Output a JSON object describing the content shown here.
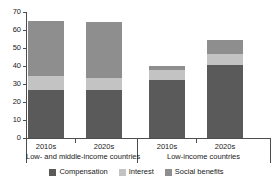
{
  "chart_data": {
    "type": "bar",
    "subtype": "stacked-grouped",
    "title": "",
    "xlabel": "",
    "ylabel": "",
    "ylim": [
      0,
      70
    ],
    "yticks": [
      0,
      10,
      20,
      30,
      40,
      50,
      60,
      70
    ],
    "grid": false,
    "legend_position": "bottom",
    "categories": [
      "2010s",
      "2020s",
      "2010s",
      "2020s"
    ],
    "groups": [
      {
        "label": "Low- and middle-income countries",
        "categories": [
          "2010s",
          "2020s"
        ]
      },
      {
        "label": "Low-income countries",
        "categories": [
          "2010s",
          "2020s"
        ]
      }
    ],
    "series": [
      {
        "name": "Compensation",
        "color": "#5a5a5a",
        "values": [
          26.5,
          26.5,
          32.0,
          40.5
        ]
      },
      {
        "name": "Interest",
        "color": "#c3c3c3",
        "values": [
          8.0,
          7.0,
          6.0,
          6.0
        ]
      },
      {
        "name": "Social benefits",
        "color": "#8e8e8e",
        "values": [
          30.5,
          31.0,
          2.0,
          8.0
        ]
      }
    ],
    "totals": [
      65.0,
      64.5,
      40.0,
      54.5
    ]
  },
  "axis": {
    "y_tick_labels": [
      "70",
      "60",
      "50",
      "40",
      "30",
      "20",
      "10",
      "0"
    ]
  },
  "legend": {
    "items": [
      {
        "label": "Compensation",
        "color": "#5a5a5a"
      },
      {
        "label": "Interest",
        "color": "#c3c3c3"
      },
      {
        "label": "Social benefits",
        "color": "#8e8e8e"
      }
    ]
  },
  "colors": {
    "compensation": "#5a5a5a",
    "interest": "#c3c3c3",
    "social_benefits": "#8e8e8e",
    "axis": "#4d4d4d",
    "text": "#1a1a1a",
    "background": "#ffffff"
  }
}
